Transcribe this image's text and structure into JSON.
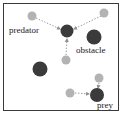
{
  "figure": {
    "type": "diagram",
    "canvas": {
      "x": 3,
      "y": 3,
      "width": 116,
      "height": 108,
      "background": "#ffffff",
      "border_color": "#3a3a3a",
      "border_width": 1
    },
    "colors": {
      "agent_dark": "#3b3b3b",
      "agent_light": "#b3b3b3",
      "arrow": "#9a9a9a",
      "label_text": "#1a1a1a",
      "frame": "#3a3a3a",
      "background": "#ffffff"
    }
  },
  "labels": [
    {
      "id": "predator",
      "text": "predator",
      "x": 9,
      "y": 25
    },
    {
      "id": "obstacle",
      "text": "obstacle",
      "x": 76,
      "y": 45
    },
    {
      "id": "prey",
      "text": "prey",
      "x": 97,
      "y": 100
    }
  ],
  "markers": [
    {
      "id": "predator-body",
      "kind": "dark",
      "cx": 67,
      "cy": 31,
      "r": 6.5
    },
    {
      "id": "obstacle-body",
      "kind": "dark",
      "cx": 94,
      "cy": 37,
      "r": 7.5
    },
    {
      "id": "obstacle-left",
      "kind": "dark",
      "cx": 40,
      "cy": 69,
      "r": 7.5
    },
    {
      "id": "prey-body",
      "kind": "dark",
      "cx": 97,
      "cy": 95,
      "r": 7.0
    },
    {
      "id": "neighbor-upleft",
      "kind": "light",
      "cx": 32,
      "cy": 16,
      "r": 4.5
    },
    {
      "id": "neighbor-upright",
      "kind": "light",
      "cx": 104,
      "cy": 13,
      "r": 4.5
    },
    {
      "id": "neighbor-below",
      "kind": "light",
      "cx": 66,
      "cy": 60,
      "r": 4.5
    },
    {
      "id": "neighbor-preyup",
      "kind": "light",
      "cx": 99,
      "cy": 78,
      "r": 4.5
    },
    {
      "id": "neighbor-preyleft",
      "kind": "light",
      "cx": 70,
      "cy": 93,
      "r": 4.5
    }
  ],
  "arrows": [
    {
      "id": "arrow-upleft-to-predator",
      "x1": 36,
      "y1": 18,
      "x2": 60,
      "y2": 29
    },
    {
      "id": "arrow-upright-to-predator",
      "x1": 101,
      "y1": 16,
      "x2": 74,
      "y2": 29
    },
    {
      "id": "arrow-below-to-predator",
      "x1": 66,
      "y1": 55,
      "x2": 67,
      "y2": 39
    },
    {
      "id": "arrow-preyup-to-prey",
      "x1": 99,
      "y1": 83,
      "x2": 98,
      "y2": 88
    },
    {
      "id": "arrow-preyleft-to-prey",
      "x1": 75,
      "y1": 93,
      "x2": 89,
      "y2": 94
    }
  ]
}
